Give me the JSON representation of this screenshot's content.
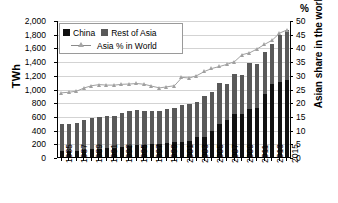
{
  "chart_data": {
    "type": "bar",
    "title": "",
    "xlabel": "",
    "ylabel": "TWh",
    "y2label": "Asian share in the world",
    "y2unit": "%",
    "ylim": [
      0,
      2000
    ],
    "y2lim": [
      0,
      50
    ],
    "ytick_step": 200,
    "y2tick_step": 5,
    "grid": true,
    "legend_position": "top-left",
    "categories": [
      1985,
      1986,
      1987,
      1988,
      1989,
      1990,
      1991,
      1992,
      1993,
      1994,
      1995,
      1996,
      1997,
      1998,
      1999,
      2000,
      2001,
      2002,
      2003,
      2004,
      2005,
      2006,
      2007,
      2008,
      2009,
      2010,
      2011,
      2012,
      2013,
      2014,
      2015
    ],
    "xtick_labels": [
      "1985",
      "1987",
      "1989",
      "1991",
      "1993",
      "1995",
      "1997",
      "1999",
      "2001",
      "2003",
      "2005",
      "2007",
      "2009",
      "2011",
      "2013",
      "2015"
    ],
    "ytick_labels": [
      "2,000",
      "1,800",
      "1,600",
      "1,400",
      "1,200",
      "1,000",
      "800",
      "600",
      "400",
      "200",
      "0"
    ],
    "y2tick_labels": [
      "50",
      "45",
      "40",
      "35",
      "30",
      "25",
      "20",
      "15",
      "10",
      "5",
      "0"
    ],
    "series": [
      {
        "name": "China",
        "type": "bar",
        "stack": "asia",
        "color": "#111111",
        "values": [
          85,
          90,
          95,
          105,
          115,
          120,
          125,
          130,
          150,
          160,
          175,
          180,
          190,
          195,
          205,
          215,
          220,
          240,
          285,
          290,
          375,
          480,
          545,
          625,
          635,
          700,
          715,
          915,
          1070,
          1090,
          1120
        ]
      },
      {
        "name": "Rest of Asia",
        "type": "bar",
        "stack": "asia",
        "color": "#595959",
        "values": [
          395,
          385,
          405,
          435,
          450,
          465,
          470,
          470,
          490,
          515,
          510,
          490,
          475,
          470,
          500,
          495,
          545,
          540,
          515,
          605,
          575,
          595,
          525,
          585,
          560,
          670,
          645,
          615,
          580,
          695,
          730
        ]
      },
      {
        "name": "Asia % in World",
        "type": "line",
        "axis": "y2",
        "color": "#a0a0a0",
        "marker": "triangle",
        "values": [
          23.8,
          24.0,
          24.4,
          25.6,
          26.4,
          26.8,
          26.6,
          26.6,
          26.9,
          27.0,
          27.2,
          26.9,
          26.2,
          25.6,
          26.0,
          26.4,
          29.4,
          29.2,
          30.1,
          31.6,
          32.7,
          33.4,
          34.2,
          35.2,
          37.7,
          38.4,
          39.8,
          41.5,
          43.0,
          45.6,
          46.8
        ]
      }
    ],
    "totals": [
      480,
      475,
      500,
      540,
      565,
      585,
      595,
      600,
      640,
      675,
      685,
      670,
      665,
      665,
      705,
      710,
      765,
      780,
      800,
      895,
      950,
      1075,
      1070,
      1210,
      1195,
      1370,
      1360,
      1530,
      1650,
      1785,
      1850
    ]
  },
  "legend": {
    "items": [
      {
        "label": "China",
        "marker": "square-black"
      },
      {
        "label": "Rest of Asia",
        "marker": "square-gray"
      },
      {
        "label": "Asia % in World",
        "marker": "line-triangle"
      }
    ]
  },
  "axes": {
    "left_title": "TWh",
    "right_title": "Asian share in the world",
    "right_unit": "%"
  }
}
